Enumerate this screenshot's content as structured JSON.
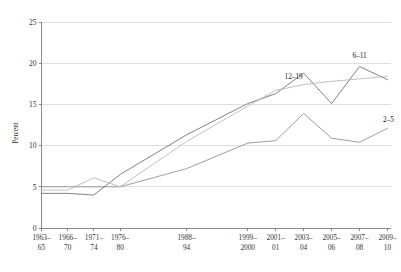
{
  "chart_data": {
    "type": "line",
    "title": "",
    "subtitle": "",
    "xlabel": "",
    "ylabel": "Percent",
    "ylim": [
      0,
      25
    ],
    "y_ticks": [
      0,
      5,
      10,
      15,
      20,
      25
    ],
    "grid": true,
    "grid_axis": "y",
    "legend_position": "inline-end-of-line",
    "categories": [
      "1963–65",
      "1966–70",
      "1971–74",
      "1976–80",
      "1988–94",
      "1999–2000",
      "2001–01",
      "2003–04",
      "2005–06",
      "2007–08",
      "2009–10"
    ],
    "category_lines": [
      [
        "1963–",
        "65"
      ],
      [
        "1966–",
        "70"
      ],
      [
        "1971–",
        "74"
      ],
      [
        "1976–",
        "80"
      ],
      [
        "1988–",
        "94"
      ],
      [
        "1999–",
        "2000"
      ],
      [
        "2001–",
        "01"
      ],
      [
        "2003–",
        "04"
      ],
      [
        "2005–",
        "06"
      ],
      [
        "2007–",
        "08"
      ],
      [
        "2009–",
        "10"
      ]
    ],
    "series": [
      {
        "name": "2–5",
        "label": "2–5",
        "color": "#8c8c8c",
        "values": [
          5.0,
          5.0,
          5.0,
          5.0,
          7.2,
          10.3,
          10.6,
          13.9,
          10.9,
          10.4,
          12.1
        ]
      },
      {
        "name": "6–11",
        "label": "6–11",
        "color": "#6b6b6b",
        "values": [
          4.2,
          4.2,
          4.0,
          6.5,
          11.3,
          15.1,
          16.3,
          18.8,
          15.1,
          19.6,
          18.0
        ]
      },
      {
        "name": "12–19",
        "label": "12–19",
        "color": "#b5b5b5",
        "values": [
          4.6,
          4.6,
          6.1,
          5.0,
          10.5,
          14.8,
          16.7,
          17.4,
          17.8,
          18.1,
          18.4
        ]
      }
    ]
  },
  "axes": {
    "y_axis_title": "Percent",
    "y_tick_labels": [
      "0",
      "5",
      "10",
      "15",
      "20",
      "25"
    ]
  },
  "series_labels": {
    "age_2_5": "2–5",
    "age_6_11": "6–11",
    "age_12_19": "12–19"
  },
  "colors": {
    "gridline": "#c8d4e2",
    "axis": "#6e6e6e",
    "text": "#333333",
    "background": "#ffffff"
  }
}
